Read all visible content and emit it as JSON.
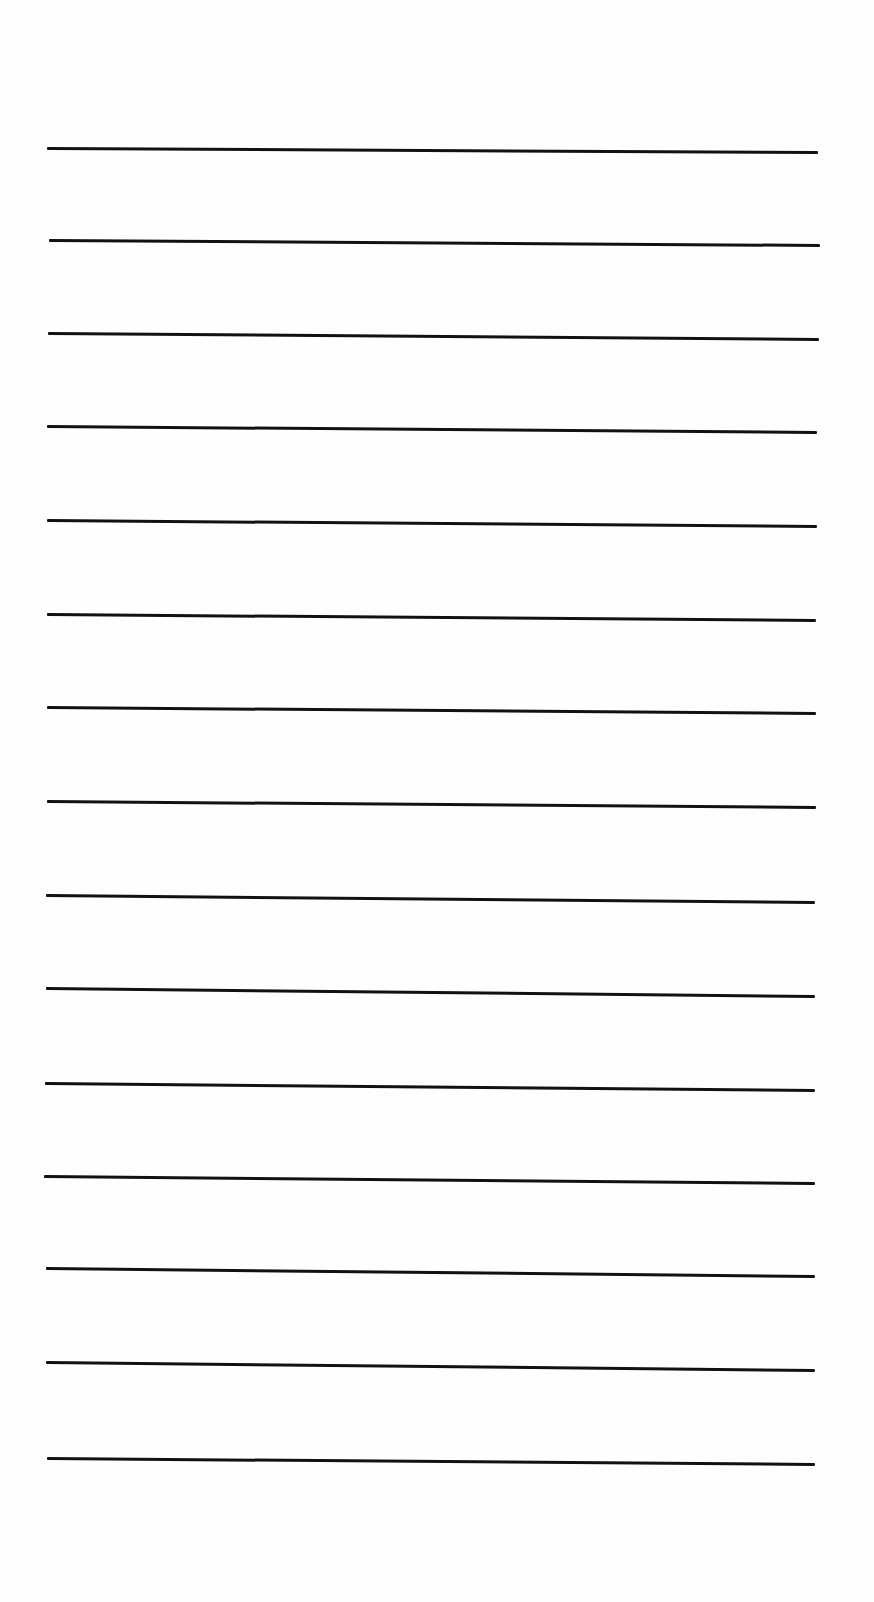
{
  "page": {
    "type": "blank-lined-sheet",
    "background_color": "#fefefe",
    "line_color": "#111111",
    "line_thickness_px": 3,
    "line_count": 15,
    "lines": [
      {
        "x1": 47,
        "y1": 148,
        "x2": 818,
        "y2": 152
      },
      {
        "x1": 49,
        "y1": 240,
        "x2": 820,
        "y2": 245
      },
      {
        "x1": 48,
        "y1": 333,
        "x2": 819,
        "y2": 339
      },
      {
        "x1": 47,
        "y1": 426,
        "x2": 817,
        "y2": 432
      },
      {
        "x1": 47,
        "y1": 520,
        "x2": 817,
        "y2": 526
      },
      {
        "x1": 47,
        "y1": 614,
        "x2": 816,
        "y2": 620
      },
      {
        "x1": 47,
        "y1": 707,
        "x2": 816,
        "y2": 713
      },
      {
        "x1": 47,
        "y1": 801,
        "x2": 816,
        "y2": 807
      },
      {
        "x1": 46,
        "y1": 895,
        "x2": 815,
        "y2": 902
      },
      {
        "x1": 46,
        "y1": 988,
        "x2": 815,
        "y2": 996
      },
      {
        "x1": 45,
        "y1": 1083,
        "x2": 815,
        "y2": 1090
      },
      {
        "x1": 44,
        "y1": 1176,
        "x2": 815,
        "y2": 1183
      },
      {
        "x1": 46,
        "y1": 1268,
        "x2": 815,
        "y2": 1276
      },
      {
        "x1": 46,
        "y1": 1362,
        "x2": 815,
        "y2": 1370
      },
      {
        "x1": 47,
        "y1": 1458,
        "x2": 815,
        "y2": 1464
      }
    ]
  }
}
